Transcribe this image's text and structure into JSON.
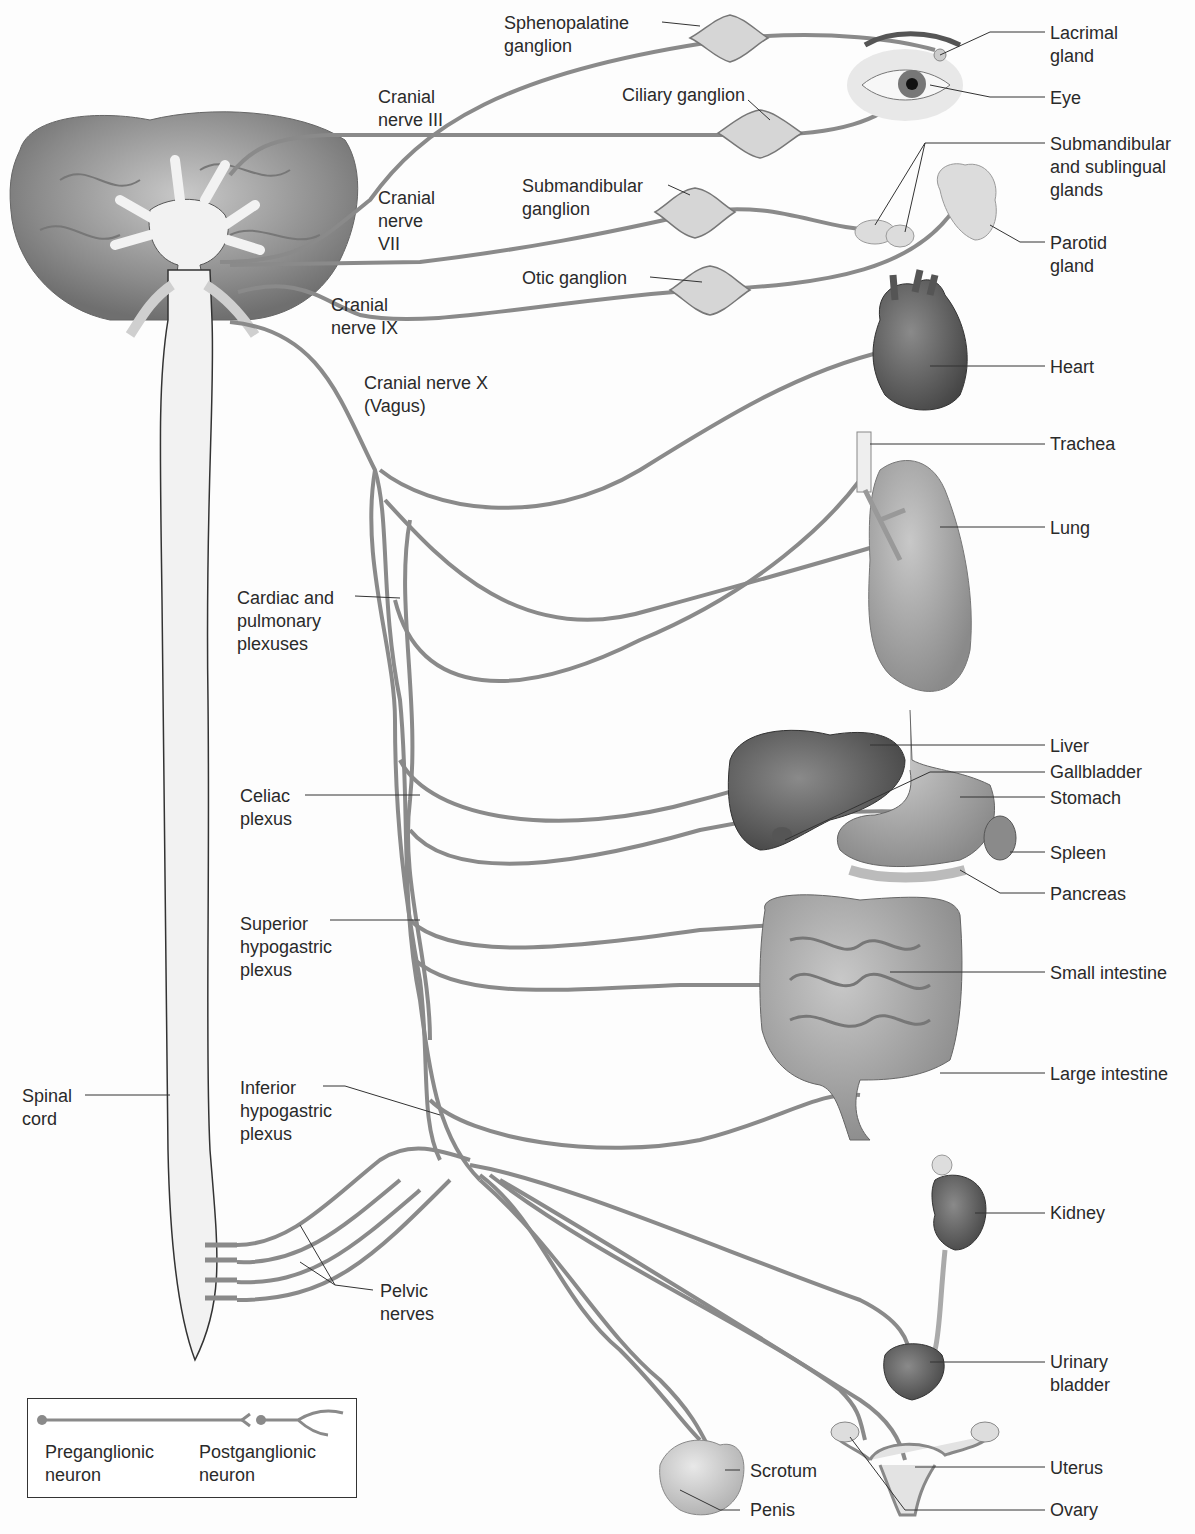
{
  "diagram": {
    "colors": {
      "nerve": "#8a8a8a",
      "ganglion": "#d6d6d6",
      "spinal_cord": "#f1f1f1",
      "label_text": "#2a2a2a",
      "leader_line": "#333333"
    },
    "ganglia_labels": {
      "sphenopalatine": "Sphenopalatine\nganglion",
      "ciliary": "Ciliary ganglion",
      "submandibular": "Submandibular\nganglion",
      "otic": "Otic ganglion"
    },
    "cranial_nerves": {
      "iii": "Cranial\nnerve III",
      "vii": "Cranial\nnerve\nVII",
      "ix": "Cranial\nnerve IX",
      "x": "Cranial nerve X\n(Vagus)"
    },
    "plexuses": {
      "cardiac_pulmonary": "Cardiac and\npulmonary\nplexuses",
      "celiac": "Celiac\nplexus",
      "superior_hypogastric": "Superior\nhypogastric\nplexus",
      "inferior_hypogastric": "Inferior\nhypogastric\nplexus",
      "pelvic_nerves": "Pelvic\nnerves"
    },
    "spinal_cord": "Spinal\ncord",
    "organs": {
      "lacrimal_gland": "Lacrimal\ngland",
      "eye": "Eye",
      "submandibular_sublingual": "Submandibular\nand sublingual\nglands",
      "parotid_gland": "Parotid\ngland",
      "heart": "Heart",
      "trachea": "Trachea",
      "lung": "Lung",
      "liver": "Liver",
      "gallbladder": "Gallbladder",
      "stomach": "Stomach",
      "spleen": "Spleen",
      "pancreas": "Pancreas",
      "small_intestine": "Small intestine",
      "large_intestine": "Large intestine",
      "kidney": "Kidney",
      "urinary_bladder": "Urinary\nbladder",
      "scrotum": "Scrotum",
      "penis": "Penis",
      "uterus": "Uterus",
      "ovary": "Ovary"
    },
    "legend": {
      "preganglionic": "Preganglionic\nneuron",
      "postganglionic": "Postganglionic\nneuron"
    }
  }
}
